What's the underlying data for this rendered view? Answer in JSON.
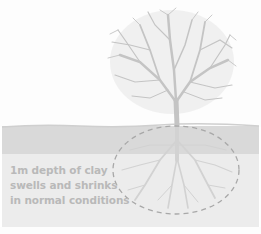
{
  "diagram": {
    "caption": {
      "line1": "1m depth of clay",
      "line2": "swells and shrinks",
      "line3": "in normal conditions"
    },
    "layers": [
      {
        "name": "sky",
        "color": "#fdfdfd"
      },
      {
        "name": "topsoil",
        "color": "#d9d9d9"
      },
      {
        "name": "clay",
        "color": "#ececec"
      }
    ],
    "colors": {
      "tree": "#c4c4c4",
      "roots": "#d2d2d2",
      "dashed_outline": "#a8a8a8",
      "caption_text": "#b9b9b9"
    }
  }
}
